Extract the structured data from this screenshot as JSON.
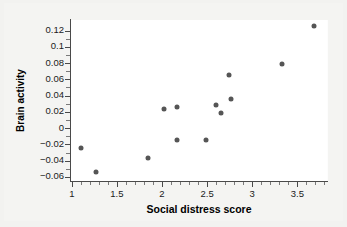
{
  "chart_data": {
    "type": "scatter",
    "title": "",
    "xlabel": "Social distress score",
    "ylabel": "Brain activity",
    "xlim": [
      0.98,
      3.84
    ],
    "ylim": [
      -0.065,
      0.133
    ],
    "grid": false,
    "legend": null,
    "xticks": [
      "1",
      "1.5",
      "2",
      "2.5",
      "3",
      "3.5"
    ],
    "xtick_values": [
      1,
      1.5,
      2,
      2.5,
      3,
      3.5
    ],
    "yticks": [
      "0.12",
      "0.1",
      "0.08",
      "0.06",
      "0.04",
      "0.02",
      "0",
      "-0.02",
      "-0.04",
      "-0.06"
    ],
    "ytick_values": [
      0.12,
      0.1,
      0.08,
      0.06,
      0.04,
      0.02,
      0,
      -0.02,
      -0.04,
      -0.06
    ],
    "point_color": "#555555",
    "axis_color": "#4a4a4a",
    "plot_background": "#ffffff",
    "figure_background": "#f2f2f0",
    "points": [
      {
        "x": 1.1,
        "y": -0.024
      },
      {
        "x": 1.27,
        "y": -0.054
      },
      {
        "x": 1.85,
        "y": -0.037
      },
      {
        "x": 2.02,
        "y": 0.023
      },
      {
        "x": 2.17,
        "y": 0.026
      },
      {
        "x": 2.17,
        "y": -0.014
      },
      {
        "x": 2.49,
        "y": -0.014
      },
      {
        "x": 2.6,
        "y": 0.029
      },
      {
        "x": 2.65,
        "y": 0.019
      },
      {
        "x": 2.74,
        "y": 0.065
      },
      {
        "x": 2.77,
        "y": 0.036
      },
      {
        "x": 3.33,
        "y": 0.079
      },
      {
        "x": 3.68,
        "y": 0.126
      }
    ]
  }
}
